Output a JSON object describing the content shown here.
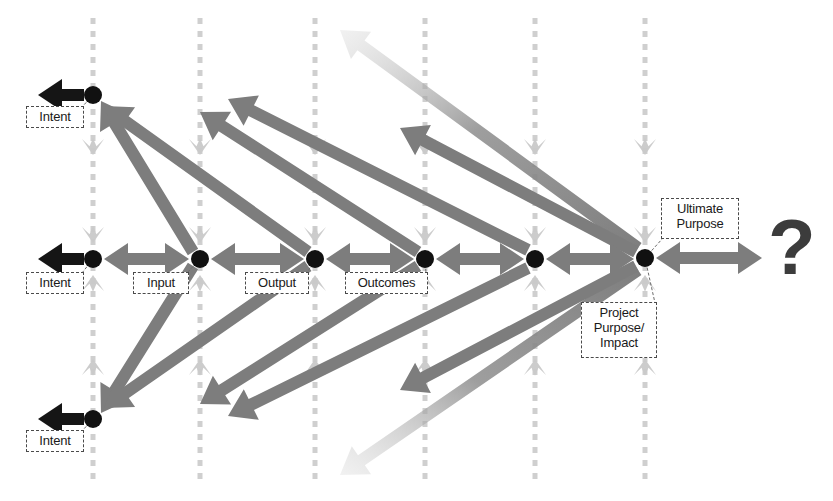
{
  "diagram": {
    "colors": {
      "node": "#111111",
      "arrow_mid": "#7d7d7d",
      "arrow_dark": "#151515",
      "arrow_light": "#c9c9c9",
      "column_line": "#cfcfcf",
      "label_border": "#4a4a4a",
      "label_text": "#1a1a1a",
      "question_mark": "#3c3c3c",
      "background": "#ffffff"
    },
    "rows": {
      "top_y": 95,
      "middle_y": 259,
      "bottom_y": 419
    },
    "columns": [
      {
        "name": "intent",
        "x": 93
      },
      {
        "name": "input",
        "x": 200
      },
      {
        "name": "output",
        "x": 315
      },
      {
        "name": "outcomes",
        "x": 425
      },
      {
        "name": "project-purpose-impact",
        "x": 535
      },
      {
        "name": "ultimate-purpose",
        "x": 645
      }
    ],
    "nodes": [
      {
        "name": "node-intent-top",
        "x": 93,
        "y": 95,
        "r": 9
      },
      {
        "name": "node-intent-middle",
        "x": 93,
        "y": 259,
        "r": 9
      },
      {
        "name": "node-intent-bottom",
        "x": 93,
        "y": 419,
        "r": 9
      },
      {
        "name": "node-input",
        "x": 200,
        "y": 259,
        "r": 9
      },
      {
        "name": "node-output",
        "x": 315,
        "y": 259,
        "r": 9
      },
      {
        "name": "node-outcomes",
        "x": 425,
        "y": 259,
        "r": 9
      },
      {
        "name": "node-project-purpose",
        "x": 535,
        "y": 259,
        "r": 9
      },
      {
        "name": "node-ultimate-purpose",
        "x": 645,
        "y": 258,
        "r": 9
      }
    ],
    "labels": [
      {
        "name": "label-intent-top",
        "text": "Intent",
        "x": 26,
        "y": 106,
        "w": 58,
        "h": 22
      },
      {
        "name": "label-intent-middle",
        "text": "Intent",
        "x": 26,
        "y": 272,
        "w": 58,
        "h": 22
      },
      {
        "name": "label-intent-bottom",
        "text": "Intent",
        "x": 26,
        "y": 430,
        "w": 58,
        "h": 22
      },
      {
        "name": "label-input",
        "text": "Input",
        "x": 133,
        "y": 272,
        "w": 56,
        "h": 22
      },
      {
        "name": "label-output",
        "text": "Output",
        "x": 245,
        "y": 272,
        "w": 64,
        "h": 22
      },
      {
        "name": "label-outcomes",
        "text": "Outcomes",
        "x": 345,
        "y": 272,
        "w": 83,
        "h": 22
      },
      {
        "name": "label-project-purpose-impact",
        "text": "Project\nPurpose/\nImpact",
        "x": 581,
        "y": 302,
        "w": 76,
        "h": 56
      },
      {
        "name": "label-ultimate-purpose",
        "text": "Ultimate\nPurpose",
        "x": 661,
        "y": 198,
        "w": 78,
        "h": 41
      }
    ],
    "question_mark": {
      "name": "question-mark",
      "text": "?",
      "x": 768,
      "y": 208
    },
    "horizontal_arrows": [
      {
        "name": "arrow-into-intent-top",
        "from_x": 38,
        "to_x": 84,
        "y": 95,
        "style": "dark",
        "heads": "single"
      },
      {
        "name": "arrow-into-intent-middle",
        "from_x": 38,
        "to_x": 84,
        "y": 259,
        "style": "dark",
        "heads": "single"
      },
      {
        "name": "arrow-into-intent-bottom",
        "from_x": 38,
        "to_x": 84,
        "y": 419,
        "style": "dark",
        "heads": "single"
      },
      {
        "name": "arrow-intent-input",
        "from_x": 104,
        "to_x": 189,
        "y": 259,
        "style": "mid",
        "heads": "double"
      },
      {
        "name": "arrow-input-output",
        "from_x": 211,
        "to_x": 304,
        "y": 259,
        "style": "mid",
        "heads": "double"
      },
      {
        "name": "arrow-output-outcomes",
        "from_x": 326,
        "to_x": 414,
        "y": 259,
        "style": "mid",
        "heads": "double"
      },
      {
        "name": "arrow-outcomes-project-purpose",
        "from_x": 436,
        "to_x": 524,
        "y": 259,
        "style": "mid",
        "heads": "double"
      },
      {
        "name": "arrow-project-purpose-ultimate",
        "from_x": 546,
        "to_x": 634,
        "y": 259,
        "style": "mid",
        "heads": "double"
      },
      {
        "name": "arrow-ultimate-to-question",
        "from_x": 656,
        "to_x": 762,
        "y": 258,
        "style": "mid",
        "heads": "double"
      }
    ],
    "diagonal_arrows": [
      {
        "name": "arrow-input-to-intent-top",
        "x1": 193,
        "y1": 252,
        "x2": 101,
        "y2": 101,
        "fade": false
      },
      {
        "name": "arrow-output-to-intent-top",
        "x1": 308,
        "y1": 252,
        "x2": 104,
        "y2": 106,
        "fade": false
      },
      {
        "name": "arrow-outcomes-to-output-up",
        "x1": 418,
        "y1": 252,
        "x2": 200,
        "y2": 112,
        "fade": false
      },
      {
        "name": "arrow-project-purpose-up",
        "x1": 528,
        "y1": 250,
        "x2": 228,
        "y2": 99,
        "fade": false
      },
      {
        "name": "arrow-ultimate-up-far",
        "x1": 638,
        "y1": 248,
        "x2": 340,
        "y2": 30,
        "fade": true
      },
      {
        "name": "arrow-ultimate-up-mid",
        "x1": 636,
        "y1": 252,
        "x2": 400,
        "y2": 128,
        "fade": false
      },
      {
        "name": "arrow-input-to-intent-bottom",
        "x1": 193,
        "y1": 266,
        "x2": 101,
        "y2": 413,
        "fade": false
      },
      {
        "name": "arrow-output-to-intent-bottom",
        "x1": 308,
        "y1": 266,
        "x2": 104,
        "y2": 408,
        "fade": false
      },
      {
        "name": "arrow-outcomes-down",
        "x1": 418,
        "y1": 266,
        "x2": 200,
        "y2": 404,
        "fade": false
      },
      {
        "name": "arrow-project-purpose-down",
        "x1": 528,
        "y1": 268,
        "x2": 228,
        "y2": 416,
        "fade": false
      },
      {
        "name": "arrow-ultimate-down-far",
        "x1": 638,
        "y1": 270,
        "x2": 340,
        "y2": 475,
        "fade": true
      },
      {
        "name": "arrow-ultimate-down-mid",
        "x1": 636,
        "y1": 266,
        "x2": 400,
        "y2": 390,
        "fade": false
      }
    ],
    "column_arrow_note": "each column carries a light grey dashed vertical line with arrowheads pointing toward the node row"
  }
}
